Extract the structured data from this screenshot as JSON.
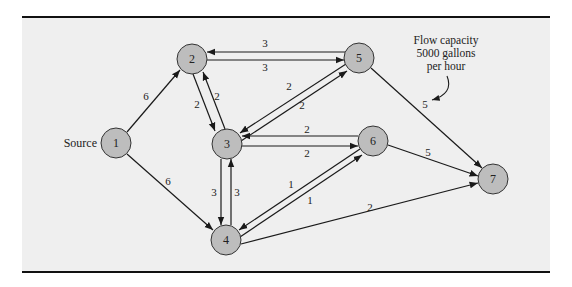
{
  "diagram": {
    "source_label": "Source",
    "annotation": {
      "lines": [
        "Flow capacity",
        "5000 gallons",
        "per hour"
      ]
    },
    "nodes": [
      {
        "id": "1",
        "label": "1",
        "x": 116,
        "y": 143
      },
      {
        "id": "2",
        "label": "2",
        "x": 192,
        "y": 59
      },
      {
        "id": "3",
        "label": "3",
        "x": 227,
        "y": 144
      },
      {
        "id": "4",
        "label": "4",
        "x": 226,
        "y": 240
      },
      {
        "id": "5",
        "label": "5",
        "x": 359,
        "y": 58
      },
      {
        "id": "6",
        "label": "6",
        "x": 373,
        "y": 141
      },
      {
        "id": "7",
        "label": "7",
        "x": 493,
        "y": 179
      }
    ],
    "edges": [
      {
        "from": "1",
        "to": "2",
        "capacity": "6"
      },
      {
        "from": "1",
        "to": "4",
        "capacity": "6"
      },
      {
        "from": "5",
        "to": "2",
        "capacity": "3"
      },
      {
        "from": "2",
        "to": "5",
        "capacity": "3"
      },
      {
        "from": "2",
        "to": "3",
        "capacity": "2"
      },
      {
        "from": "3",
        "to": "2",
        "capacity": "2"
      },
      {
        "from": "5",
        "to": "3",
        "capacity": "2"
      },
      {
        "from": "3",
        "to": "5",
        "capacity": "2"
      },
      {
        "from": "6",
        "to": "3",
        "capacity": "2"
      },
      {
        "from": "3",
        "to": "6",
        "capacity": "2"
      },
      {
        "from": "3",
        "to": "4",
        "capacity": "3"
      },
      {
        "from": "4",
        "to": "3",
        "capacity": "3"
      },
      {
        "from": "6",
        "to": "4",
        "capacity": "1"
      },
      {
        "from": "4",
        "to": "6",
        "capacity": "1"
      },
      {
        "from": "4",
        "to": "7",
        "capacity": "2"
      },
      {
        "from": "5",
        "to": "7",
        "capacity": "5"
      },
      {
        "from": "6",
        "to": "7",
        "capacity": "5"
      }
    ],
    "colors": {
      "background": "#efefef",
      "node_fill": "#bdbdbd",
      "line": "#1a1a1a"
    }
  }
}
